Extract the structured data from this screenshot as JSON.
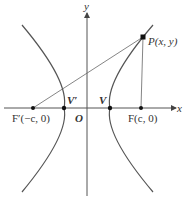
{
  "diagram": {
    "axes": {
      "x_label": "x",
      "y_label": "y",
      "origin_label": "O"
    },
    "points": {
      "focus_left": {
        "label": "F′(−c, 0)"
      },
      "vertex_left": {
        "label": "V′"
      },
      "vertex_right": {
        "label": "V"
      },
      "focus_right": {
        "label": "F(c, 0)"
      },
      "point_p": {
        "label": "P(x, y)"
      }
    },
    "colors": {
      "curve": "#555555",
      "axis": "#555555",
      "point": "#111111"
    }
  }
}
